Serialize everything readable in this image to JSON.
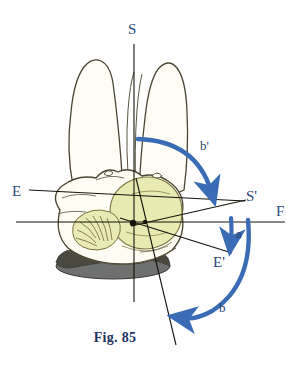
{
  "figure": {
    "caption": "Fig. 85",
    "background_color": "#ffffff",
    "ink_color": "#2b2b20",
    "accent_blue": "#3a6bb5",
    "label_blue": "#2d4a7c",
    "skin_cream": "#fdfdf3",
    "head_yellow": "#eaeab4",
    "base_gray": "#6f7070"
  },
  "axes": [
    {
      "id": "S",
      "label": "S",
      "kind": "axis-endpoint-label",
      "description": "superior end of vertical sagittal axis"
    },
    {
      "id": "E",
      "label": "E",
      "kind": "axis-endpoint-label",
      "description": "left end of oblique E-S' axis"
    },
    {
      "id": "Sp",
      "label": "S'",
      "kind": "axis-endpoint-label",
      "description": "right end of oblique axis"
    },
    {
      "id": "F",
      "label": "F",
      "kind": "axis-endpoint-label",
      "description": "right end of horizontal reference line"
    },
    {
      "id": "Ep",
      "label": "E'",
      "kind": "axis-endpoint-label",
      "description": "lower-right end of second oblique axis"
    }
  ],
  "arcs": [
    {
      "id": "b-prime",
      "label": "b'",
      "color": "#3a6bb5",
      "direction": "clockwise",
      "description": "large upper arc sweeping from sagittal axis down to the right"
    },
    {
      "id": "a",
      "label": "a",
      "color": "#3a6bb5",
      "direction": "downward",
      "description": "short straight arrow pointing down"
    },
    {
      "id": "b",
      "label": "b",
      "color": "#3a6bb5",
      "direction": "counter-clockwise",
      "description": "large lower-right arc sweeping down and to the left"
    }
  ],
  "illustration": {
    "name": "pelvis-with-fetal-head-diagram",
    "parts": [
      {
        "name": "left-thigh",
        "fill": "#fdfdf6"
      },
      {
        "name": "right-thigh",
        "fill": "#fdfdf6"
      },
      {
        "name": "pelvis-body",
        "fill": "#fdfdf3"
      },
      {
        "name": "fetal-head",
        "fill": "#e9e9b2"
      },
      {
        "name": "perineum-detail",
        "fill": "#eaeab4"
      },
      {
        "name": "support-base",
        "fill": "#6f7070"
      }
    ]
  }
}
